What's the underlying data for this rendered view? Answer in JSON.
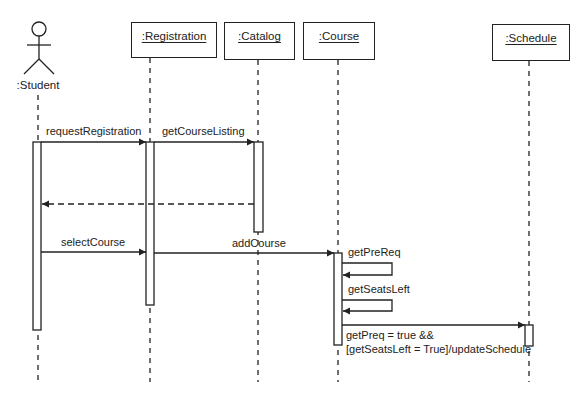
{
  "diagram": {
    "type": "uml-sequence",
    "actor": {
      "label": ":Student"
    },
    "objects": [
      {
        "id": "registration",
        "label": ":Registration"
      },
      {
        "id": "catalog",
        "label": ":Catalog"
      },
      {
        "id": "course",
        "label": ":Course"
      },
      {
        "id": "schedule",
        "label": ":Schedule"
      }
    ],
    "messages": [
      {
        "id": "m1",
        "from": "student",
        "to": "registration",
        "label": "requestRegistration",
        "kind": "sync"
      },
      {
        "id": "m2",
        "from": "registration",
        "to": "catalog",
        "label": "getCourseListing",
        "kind": "sync"
      },
      {
        "id": "m3",
        "from": "catalog",
        "to": "student",
        "label": "",
        "kind": "return"
      },
      {
        "id": "m4",
        "from": "student",
        "to": "registration",
        "label": "selectCourse",
        "kind": "sync"
      },
      {
        "id": "m5",
        "from": "registration",
        "to": "course",
        "label": "addCourse",
        "kind": "sync"
      },
      {
        "id": "m6",
        "from": "course",
        "to": "course",
        "label": "getPreReq",
        "kind": "self"
      },
      {
        "id": "m7",
        "from": "course",
        "to": "course",
        "label": "getSeatsLeft",
        "kind": "self"
      },
      {
        "id": "m8",
        "from": "course",
        "to": "schedule",
        "label_line1": "getPreq = true &&",
        "label_line2": "[getSeatsLeft = True]/updateSchedule",
        "kind": "sync"
      }
    ]
  }
}
